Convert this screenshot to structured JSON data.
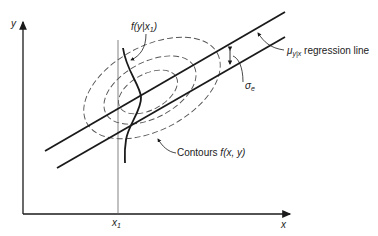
{
  "diagram": {
    "axes": {
      "x_label": "x",
      "y_label": "y",
      "x_marker": "x",
      "x_marker_sub": "1"
    },
    "labels": {
      "conditional": {
        "f": "f(y|x",
        "sub": "1",
        "close": ")"
      },
      "regression": {
        "mu": "μ",
        "sub": "y|x",
        "text": " regression line"
      },
      "sigma": {
        "sym": "σ",
        "sub": "e"
      },
      "contours": {
        "text": "Contours ",
        "fn": "f(x, y)"
      }
    },
    "colors": {
      "ink": "#1a1a1a",
      "dashed": "#555555",
      "background": "#ffffff"
    }
  }
}
